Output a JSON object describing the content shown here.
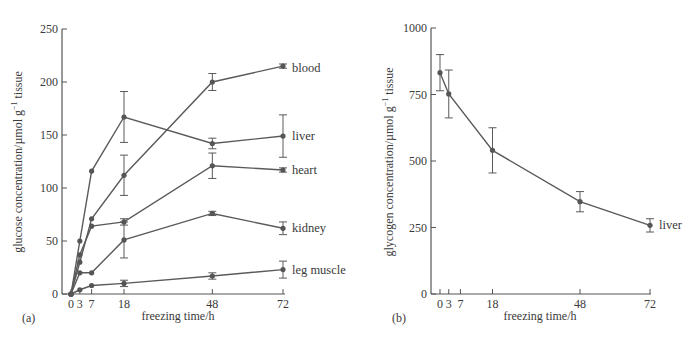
{
  "chart_data": [
    {
      "panel": "(a)",
      "type": "line",
      "title": "",
      "xlabel": "freezing time/h",
      "ylabel": "glucose concentration/µmol g⁻¹ tissue",
      "ylabel_parts": {
        "main": "glucose concentration/µmol g",
        "sup": "−1",
        "tail": " tissue"
      },
      "x_ticks": [
        0,
        3,
        7,
        18,
        48,
        72
      ],
      "y_ticks": [
        0,
        50,
        100,
        150,
        200,
        250
      ],
      "xlim": [
        0,
        72
      ],
      "ylim": [
        0,
        250
      ],
      "grid": false,
      "legend_position": "inline-right",
      "x": [
        0,
        3,
        7,
        18,
        48,
        72
      ],
      "series": [
        {
          "name": "blood",
          "values": [
            0,
            30,
            71,
            112,
            200,
            215
          ],
          "errors": [
            0,
            0,
            0,
            19,
            8,
            2
          ]
        },
        {
          "name": "liver",
          "values": [
            0,
            50,
            116,
            167,
            142,
            149
          ],
          "errors": [
            0,
            0,
            0,
            24,
            5,
            20
          ]
        },
        {
          "name": "heart",
          "values": [
            0,
            37,
            64,
            68,
            121,
            117
          ],
          "errors": [
            0,
            0,
            0,
            3,
            12,
            2
          ]
        },
        {
          "name": "kidney",
          "values": [
            0,
            20,
            20,
            51,
            76,
            62
          ],
          "errors": [
            0,
            0,
            0,
            17,
            2,
            6
          ]
        },
        {
          "name": "leg muscle",
          "values": [
            0,
            4,
            8,
            10,
            17,
            23
          ],
          "errors": [
            0,
            0,
            0,
            3,
            3,
            8
          ]
        }
      ]
    },
    {
      "panel": "(b)",
      "type": "line",
      "title": "",
      "xlabel": "freezing time/h",
      "ylabel": "glycogen concentration/µmol g⁻¹ tissue",
      "ylabel_parts": {
        "main": "glycogen concentration/µmol g",
        "sup": "−1",
        "tail": " tissue"
      },
      "x_ticks": [
        0,
        3,
        7,
        18,
        48,
        72
      ],
      "y_ticks": [
        0,
        250,
        500,
        750,
        1000
      ],
      "xlim": [
        0,
        72
      ],
      "ylim": [
        0,
        1000
      ],
      "grid": false,
      "legend_position": "inline-right",
      "x": [
        0,
        3,
        18,
        48,
        72
      ],
      "series": [
        {
          "name": "liver",
          "values": [
            832,
            752,
            540,
            347,
            258
          ],
          "errors": [
            68,
            90,
            85,
            38,
            25
          ]
        }
      ]
    }
  ],
  "panels": {
    "a": {
      "label": "(a)",
      "xlabel": "freezing time/h",
      "ylabel_main": "glucose concentration/µmol g",
      "ylabel_sup": "−1",
      "ylabel_tail": " tissue"
    },
    "b": {
      "label": "(b)",
      "xlabel": "freezing time/h",
      "ylabel_main": "glycogen concentration/µmol g",
      "ylabel_sup": "−1",
      "ylabel_tail": " tissue"
    }
  }
}
